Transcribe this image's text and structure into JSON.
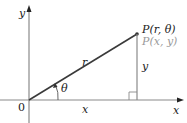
{
  "diagram": {
    "axes": {
      "x_label": "x",
      "y_label": "y",
      "origin_label": "0"
    },
    "point": {
      "polar_label": "P(r, θ)",
      "cartesian_label": "P(x, y)"
    },
    "segments": {
      "radius_label": "r",
      "horizontal_label": "x",
      "vertical_label": "y"
    },
    "angle_label": "θ",
    "colors": {
      "axes": "#8a8a8a",
      "radius": "#3a3a3a",
      "text": "#222222",
      "secondary_text": "#9a9a9a"
    }
  }
}
